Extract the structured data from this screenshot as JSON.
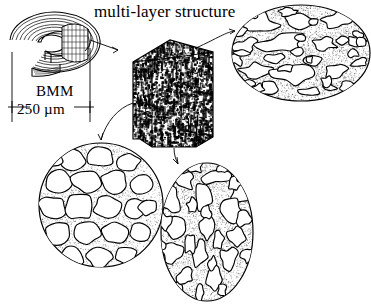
{
  "figure": {
    "title": "multi-layer structure",
    "domain": "scientific-schematic",
    "ink_color": "#000000",
    "background_color": "#ffffff",
    "stipple_color": "#3a3a3a"
  },
  "labels": {
    "title": "multi-layer structure",
    "bmm": "BMM",
    "dimension": "250 µm"
  },
  "elements": {
    "scroll": {
      "name": "BMM multi-layer scroll",
      "shape": "open C-shaped spiral ring, cut-away",
      "layer_count": 7,
      "cut_face_hatch": "grid"
    },
    "block": {
      "name": "multi-layer prism block",
      "shape": "hexagonal prism",
      "texture": "dense dark speckle"
    },
    "sections": [
      {
        "id": "top-right",
        "shape": "ellipse-wide",
        "texture": "stippled matrix with irregular elongated pores",
        "pore_count": 26
      },
      {
        "id": "bottom-left",
        "shape": "circle",
        "texture": "honeycomb foam, polygonal cells with thin stippled walls",
        "pore_count": 22
      },
      {
        "id": "bottom-center",
        "shape": "ellipse-tall",
        "texture": "stippled matrix with stretched vertical pores",
        "pore_count": 30
      }
    ],
    "connectors": [
      {
        "id": "scroll-to-block",
        "from": "scroll",
        "to": "block",
        "style": "arrow-straight"
      },
      {
        "id": "block-to-top-right",
        "from": "block",
        "to": "top-right",
        "style": "arrow-curved"
      },
      {
        "id": "block-to-bottom-left",
        "from": "block",
        "to": "bottom-left",
        "style": "arrow-curved"
      },
      {
        "id": "block-to-bottom-center",
        "from": "block",
        "to": "bottom-center",
        "style": "arrow-curved"
      }
    ],
    "dimension_line": {
      "value": "250 µm",
      "measures": "scroll outer diameter",
      "style": "extension-lines-with-end-ticks"
    }
  }
}
